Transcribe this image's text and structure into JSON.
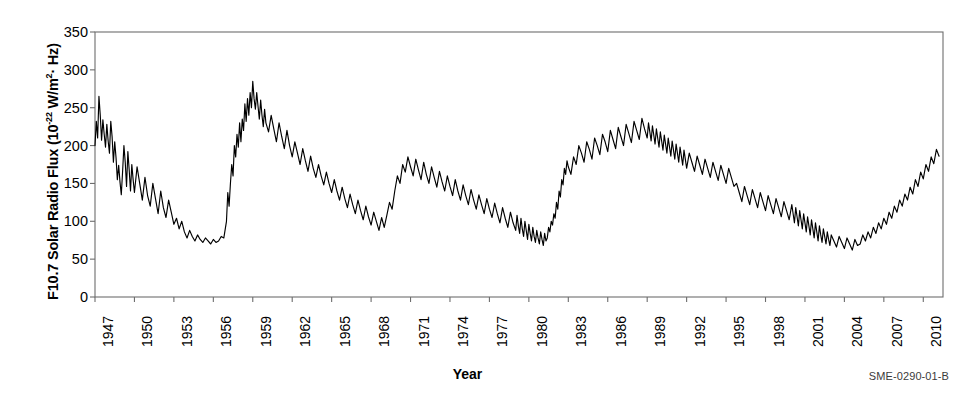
{
  "chart_data": {
    "type": "line",
    "title": "",
    "xlabel": "Year",
    "ylabel": "F10.7 Solar Radio Flux (10-22 W/m2· Hz)",
    "ylabel_prefix": "F10.7 Solar Radio Flux (10",
    "ylabel_exponent": "-22",
    "ylabel_suffix_a": " W/m",
    "ylabel_exponent_b": "2",
    "ylabel_suffix_b": "· Hz)",
    "credit": "SME-0290-01-B",
    "xlim": [
      1947,
      2011.5
    ],
    "ylim": [
      0,
      350
    ],
    "grid": false,
    "legend": "none",
    "line_color": "#000000",
    "axis_color": "#6d6d6d",
    "ytick_labels": [
      "0",
      "50",
      "100",
      "150",
      "200",
      "250",
      "300",
      "350"
    ],
    "ytick_values": [
      0,
      50,
      100,
      150,
      200,
      250,
      300,
      350
    ],
    "xtick_labels": [
      "1947",
      "1950",
      "1953",
      "1956",
      "1959",
      "1962",
      "1965",
      "1968",
      "1971",
      "1974",
      "1977",
      "1980",
      "1983",
      "1986",
      "1989",
      "1992",
      "1995",
      "1998",
      "2001",
      "2004",
      "2007",
      "2010"
    ],
    "xtick_values": [
      1947,
      1950,
      1953,
      1956,
      1959,
      1962,
      1965,
      1968,
      1971,
      1974,
      1977,
      1980,
      1983,
      1986,
      1989,
      1992,
      1995,
      1998,
      2001,
      2004,
      2007,
      2010
    ],
    "series_name": "F10.7 monthly solar radio flux",
    "x": [
      1947.0,
      1947.1,
      1947.2,
      1947.3,
      1947.4,
      1947.5,
      1947.6,
      1947.7,
      1947.8,
      1947.9,
      1948.0,
      1948.1,
      1948.2,
      1948.3,
      1948.4,
      1948.5,
      1948.6,
      1948.7,
      1948.8,
      1948.9,
      1949.0,
      1949.1,
      1949.2,
      1949.3,
      1949.4,
      1949.5,
      1949.6,
      1949.7,
      1949.8,
      1949.9,
      1950.0,
      1950.2,
      1950.4,
      1950.6,
      1950.8,
      1951.0,
      1951.2,
      1951.4,
      1951.6,
      1951.8,
      1952.0,
      1952.2,
      1952.4,
      1952.6,
      1952.8,
      1953.0,
      1953.2,
      1953.4,
      1953.6,
      1953.8,
      1954.0,
      1954.2,
      1954.4,
      1954.6,
      1954.8,
      1955.0,
      1955.2,
      1955.4,
      1955.6,
      1955.8,
      1956.0,
      1956.2,
      1956.4,
      1956.6,
      1956.8,
      1957.0,
      1957.1,
      1957.2,
      1957.3,
      1957.4,
      1957.5,
      1957.6,
      1957.7,
      1957.8,
      1957.9,
      1958.0,
      1958.1,
      1958.2,
      1958.3,
      1958.4,
      1958.5,
      1958.6,
      1958.7,
      1958.8,
      1958.9,
      1959.0,
      1959.1,
      1959.2,
      1959.3,
      1959.4,
      1959.5,
      1959.6,
      1959.7,
      1959.8,
      1959.9,
      1960.0,
      1960.2,
      1960.4,
      1960.6,
      1960.8,
      1961.0,
      1961.2,
      1961.4,
      1961.6,
      1961.8,
      1962.0,
      1962.2,
      1962.4,
      1962.6,
      1962.8,
      1963.0,
      1963.2,
      1963.4,
      1963.6,
      1963.8,
      1964.0,
      1964.2,
      1964.4,
      1964.6,
      1964.8,
      1965.0,
      1965.2,
      1965.4,
      1965.6,
      1965.8,
      1966.0,
      1966.2,
      1966.4,
      1966.6,
      1966.8,
      1967.0,
      1967.2,
      1967.4,
      1967.6,
      1967.8,
      1968.0,
      1968.2,
      1968.4,
      1968.6,
      1968.8,
      1969.0,
      1969.2,
      1969.4,
      1969.6,
      1969.8,
      1970.0,
      1970.2,
      1970.4,
      1970.6,
      1970.8,
      1971.0,
      1971.2,
      1971.4,
      1971.6,
      1971.8,
      1972.0,
      1972.2,
      1972.4,
      1972.6,
      1972.8,
      1973.0,
      1973.2,
      1973.4,
      1973.6,
      1973.8,
      1974.0,
      1974.2,
      1974.4,
      1974.6,
      1974.8,
      1975.0,
      1975.2,
      1975.4,
      1975.6,
      1975.8,
      1976.0,
      1976.2,
      1976.4,
      1976.6,
      1976.8,
      1977.0,
      1977.2,
      1977.4,
      1977.6,
      1977.8,
      1978.0,
      1978.2,
      1978.4,
      1978.6,
      1978.8,
      1979.0,
      1979.1,
      1979.2,
      1979.3,
      1979.4,
      1979.5,
      1979.6,
      1979.7,
      1979.8,
      1979.9,
      1980.0,
      1980.1,
      1980.2,
      1980.3,
      1980.4,
      1980.5,
      1980.6,
      1980.7,
      1980.8,
      1980.9,
      1981.0,
      1981.1,
      1981.2,
      1981.3,
      1981.4,
      1981.5,
      1981.6,
      1981.7,
      1981.8,
      1981.9,
      1982.0,
      1982.1,
      1982.2,
      1982.3,
      1982.4,
      1982.5,
      1982.6,
      1982.7,
      1982.8,
      1982.9,
      1983.0,
      1983.2,
      1983.4,
      1983.6,
      1983.8,
      1984.0,
      1984.2,
      1984.4,
      1984.6,
      1984.8,
      1985.0,
      1985.2,
      1985.4,
      1985.6,
      1985.8,
      1986.0,
      1986.2,
      1986.4,
      1986.6,
      1986.8,
      1987.0,
      1987.2,
      1987.4,
      1987.6,
      1987.8,
      1988.0,
      1988.2,
      1988.4,
      1988.6,
      1988.8,
      1989.0,
      1989.1,
      1989.2,
      1989.3,
      1989.4,
      1989.5,
      1989.6,
      1989.7,
      1989.8,
      1989.9,
      1990.0,
      1990.1,
      1990.2,
      1990.3,
      1990.4,
      1990.5,
      1990.6,
      1990.7,
      1990.8,
      1990.9,
      1991.0,
      1991.1,
      1991.2,
      1991.3,
      1991.4,
      1991.5,
      1991.6,
      1991.7,
      1991.8,
      1991.9,
      1992.0,
      1992.2,
      1992.4,
      1992.6,
      1992.8,
      1993.0,
      1993.2,
      1993.4,
      1993.6,
      1993.8,
      1994.0,
      1994.2,
      1994.4,
      1994.6,
      1994.8,
      1995.0,
      1995.2,
      1995.4,
      1995.6,
      1995.8,
      1996.0,
      1996.2,
      1996.4,
      1996.6,
      1996.8,
      1997.0,
      1997.2,
      1997.4,
      1997.6,
      1997.8,
      1998.0,
      1998.2,
      1998.4,
      1998.6,
      1998.8,
      1999.0,
      1999.2,
      1999.4,
      1999.6,
      1999.8,
      2000.0,
      2000.1,
      2000.2,
      2000.3,
      2000.4,
      2000.5,
      2000.6,
      2000.7,
      2000.8,
      2000.9,
      2001.0,
      2001.1,
      2001.2,
      2001.3,
      2001.4,
      2001.5,
      2001.6,
      2001.7,
      2001.8,
      2001.9,
      2002.0,
      2002.1,
      2002.2,
      2002.3,
      2002.4,
      2002.5,
      2002.6,
      2002.7,
      2002.8,
      2002.9,
      2003.0,
      2003.2,
      2003.4,
      2003.6,
      2003.8,
      2004.0,
      2004.2,
      2004.4,
      2004.6,
      2004.8,
      2005.0,
      2005.2,
      2005.4,
      2005.6,
      2005.8,
      2006.0,
      2006.2,
      2006.4,
      2006.6,
      2006.8,
      2007.0,
      2007.2,
      2007.4,
      2007.6,
      2007.8,
      2008.0,
      2008.2,
      2008.4,
      2008.6,
      2008.8,
      2009.0,
      2009.2,
      2009.4,
      2009.6,
      2009.8,
      2010.0,
      2010.2,
      2010.4,
      2010.6,
      2010.8,
      2011.0,
      2011.2
    ],
    "y": [
      200,
      232,
      210,
      265,
      240,
      207,
      234,
      215,
      198,
      228,
      206,
      190,
      232,
      212,
      178,
      205,
      184,
      155,
      174,
      152,
      135,
      166,
      200,
      178,
      146,
      192,
      168,
      140,
      175,
      155,
      138,
      172,
      150,
      128,
      158,
      134,
      120,
      150,
      130,
      110,
      140,
      118,
      105,
      128,
      112,
      96,
      104,
      90,
      100,
      86,
      78,
      88,
      80,
      74,
      82,
      76,
      72,
      78,
      74,
      70,
      76,
      72,
      74,
      80,
      78,
      100,
      138,
      120,
      150,
      175,
      160,
      200,
      185,
      215,
      198,
      230,
      205,
      235,
      220,
      255,
      232,
      262,
      240,
      270,
      250,
      285,
      262,
      248,
      270,
      252,
      235,
      260,
      240,
      225,
      248,
      230,
      218,
      240,
      222,
      205,
      230,
      212,
      196,
      220,
      200,
      185,
      205,
      190,
      175,
      196,
      180,
      166,
      186,
      170,
      158,
      175,
      160,
      148,
      165,
      150,
      138,
      155,
      140,
      128,
      145,
      130,
      118,
      136,
      122,
      110,
      128,
      114,
      102,
      120,
      106,
      95,
      112,
      100,
      88,
      105,
      92,
      108,
      125,
      116,
      140,
      160,
      150,
      175,
      165,
      185,
      172,
      160,
      182,
      168,
      155,
      178,
      162,
      150,
      172,
      158,
      145,
      166,
      152,
      140,
      160,
      146,
      134,
      155,
      140,
      128,
      148,
      134,
      122,
      142,
      128,
      116,
      135,
      122,
      110,
      130,
      116,
      105,
      124,
      110,
      98,
      118,
      104,
      92,
      112,
      98,
      88,
      108,
      94,
      84,
      104,
      90,
      80,
      100,
      88,
      76,
      96,
      84,
      74,
      92,
      80,
      72,
      88,
      78,
      70,
      86,
      76,
      68,
      84,
      74,
      78,
      92,
      86,
      100,
      95,
      110,
      104,
      125,
      116,
      140,
      132,
      155,
      148,
      170,
      162,
      180,
      172,
      162,
      185,
      175,
      200,
      190,
      178,
      205,
      195,
      182,
      210,
      200,
      188,
      215,
      205,
      192,
      220,
      208,
      196,
      224,
      212,
      200,
      228,
      216,
      204,
      232,
      220,
      208,
      236,
      222,
      210,
      230,
      218,
      206,
      226,
      214,
      202,
      222,
      210,
      198,
      218,
      206,
      194,
      214,
      202,
      190,
      210,
      198,
      186,
      206,
      194,
      182,
      202,
      190,
      178,
      198,
      186,
      174,
      194,
      182,
      170,
      190,
      178,
      166,
      186,
      174,
      162,
      182,
      170,
      158,
      178,
      166,
      154,
      174,
      162,
      150,
      170,
      158,
      146,
      150,
      138,
      126,
      146,
      134,
      122,
      142,
      130,
      118,
      138,
      126,
      114,
      134,
      122,
      110,
      130,
      118,
      106,
      126,
      114,
      102,
      122,
      110,
      98,
      118,
      106,
      94,
      114,
      102,
      90,
      110,
      98,
      86,
      106,
      94,
      82,
      102,
      90,
      78,
      98,
      86,
      74,
      94,
      82,
      72,
      90,
      80,
      70,
      86,
      76,
      68,
      82,
      74,
      66,
      80,
      72,
      64,
      78,
      70,
      62,
      76,
      68,
      70,
      82,
      74,
      86,
      78,
      92,
      84,
      98,
      90,
      104,
      96,
      112,
      104,
      120,
      112,
      128,
      120,
      136,
      128,
      145,
      136,
      155,
      146,
      165,
      156,
      175,
      166,
      185,
      176,
      195,
      186,
      205,
      196,
      215,
      206,
      222,
      212,
      230,
      220,
      238,
      228,
      234,
      224,
      242,
      232,
      226,
      236,
      228,
      218,
      232,
      222,
      212,
      226,
      216,
      206,
      220,
      210,
      200,
      214,
      204,
      194,
      208,
      198,
      188,
      202,
      192,
      182,
      196,
      186,
      176,
      190,
      180,
      170,
      184,
      174,
      164,
      178,
      168,
      158,
      172,
      162,
      152,
      166,
      156,
      146,
      160,
      150,
      140,
      154,
      144,
      134,
      148,
      138,
      128,
      142,
      132,
      122,
      136,
      126,
      116,
      130,
      120,
      110,
      124,
      114,
      104,
      118,
      108,
      98,
      112,
      102,
      92,
      106,
      96,
      86,
      100,
      90,
      80,
      94,
      86,
      76,
      90,
      82,
      74,
      86,
      78,
      72,
      84,
      76,
      70,
      82,
      74,
      68,
      80,
      72,
      66,
      78,
      70,
      64,
      76,
      68,
      62,
      74,
      66,
      60,
      72,
      64,
      58,
      70,
      62,
      56,
      68,
      62,
      58,
      66,
      60,
      56,
      64,
      60,
      58,
      66,
      62,
      58,
      68,
      64,
      60,
      70,
      66,
      62,
      72,
      68,
      64,
      74,
      70,
      66,
      76,
      72,
      68,
      78,
      74,
      70,
      80,
      76,
      72,
      82,
      78,
      74,
      84,
      80,
      76,
      86,
      82,
      78,
      88,
      84
    ]
  }
}
